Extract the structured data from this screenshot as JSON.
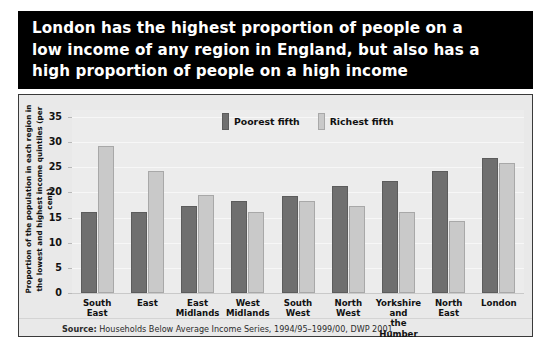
{
  "title": "London has the highest proportion of people on a\nlow income of any region in England, but also has a\nhigh proportion of people on a high income",
  "legend": {
    "position": "top-center",
    "items": [
      {
        "label": "Poorest fifth",
        "color": "#6f6f6f",
        "swatch": "poorest-swatch"
      },
      {
        "label": "Richest fifth",
        "color": "#c9c9c9",
        "swatch": "richest-swatch"
      }
    ]
  },
  "source": {
    "prefix": "Source:",
    "text": " Households Below Average Income Series, 1994/95–1999/00, DWP 2001"
  },
  "yaxis": {
    "title_line1": "Proportion of the population in each region in",
    "title_line2": "the lowest and highest income quintiles (per cent)",
    "ticks": [
      "0",
      "5",
      "10",
      "15",
      "20",
      "25",
      "30",
      "35"
    ]
  },
  "chart_data": {
    "type": "bar",
    "title": "London has the highest proportion of people on a low income of any region in England, but also has a high proportion of people on a high income",
    "xlabel": "",
    "ylabel": "Proportion of the population in each region in the lowest and highest income quintiles (per cent)",
    "ylim": [
      0,
      35
    ],
    "yticks": [
      0,
      5,
      10,
      15,
      20,
      25,
      30,
      35
    ],
    "grid": true,
    "legend_position": "top-center",
    "categories": [
      "South\nEast",
      "East",
      "East\nMidlands",
      "West\nMidlands",
      "South\nWest",
      "North\nWest",
      "Yorkshire\nand\nthe Humber",
      "North\nEast",
      "London"
    ],
    "series": [
      {
        "name": "Poorest fifth",
        "color": "#6f6f6f",
        "values": [
          16.2,
          16.2,
          17.3,
          18.2,
          19.2,
          21.2,
          22.2,
          24.2,
          26.8
        ]
      },
      {
        "name": "Richest fifth",
        "color": "#c9c9c9",
        "values": [
          29.3,
          24.3,
          19.4,
          16.2,
          18.2,
          17.3,
          16.2,
          14.4,
          25.9
        ]
      }
    ],
    "source": "Households Below Average Income Series, 1994/95–1999/00, DWP 2001"
  }
}
